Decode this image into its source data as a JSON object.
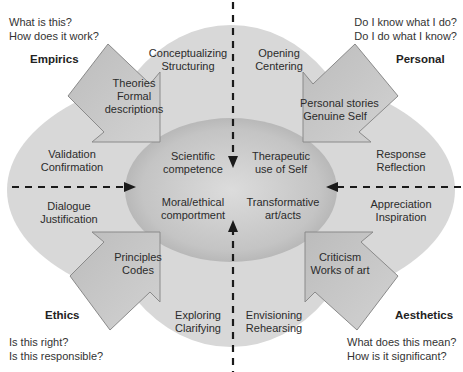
{
  "colors": {
    "outer_fill": "#d6d6d6",
    "inner_fill": "#bdbdbd",
    "arrow_fill": "#c6c6c6",
    "arrow_stroke": "#8a8a8a",
    "dash": "#1a1a1a",
    "background": "#ffffff"
  },
  "quadrants": {
    "empirics": {
      "title": "Empirics",
      "questions": [
        "What is this?",
        "How does it work?"
      ],
      "arrow_text": [
        "Theories",
        "Formal",
        "descriptions"
      ],
      "outer_top": [
        "Conceptualizing",
        "Structuring"
      ],
      "outer_side": [
        "Validation",
        "Confirmation"
      ],
      "inner": [
        "Scientific",
        "competence"
      ]
    },
    "personal": {
      "title": "Personal",
      "questions": [
        "Do I know what I do?",
        "Do I do what I know?"
      ],
      "arrow_text": [
        "Personal stories",
        "Genuine Self"
      ],
      "outer_top": [
        "Opening",
        "Centering"
      ],
      "outer_side": [
        "Response",
        "Reflection"
      ],
      "inner": [
        "Therapeutic",
        "use of Self"
      ]
    },
    "ethics": {
      "title": "Ethics",
      "questions": [
        "Is this right?",
        "Is this responsible?"
      ],
      "arrow_text": [
        "Principles",
        "Codes"
      ],
      "outer_bottom": [
        "Exploring",
        "Clarifying"
      ],
      "outer_side": [
        "Dialogue",
        "Justification"
      ],
      "inner": [
        "Moral/ethical",
        "comportment"
      ]
    },
    "aesthetics": {
      "title": "Aesthetics",
      "questions": [
        "What does this mean?",
        "How is it significant?"
      ],
      "arrow_text": [
        "Criticism",
        "Works of art"
      ],
      "outer_bottom": [
        "Envisioning",
        "Rehearsing"
      ],
      "outer_side": [
        "Appreciation",
        "Inspiration"
      ],
      "inner": [
        "Transformative",
        "art/acts"
      ]
    }
  }
}
